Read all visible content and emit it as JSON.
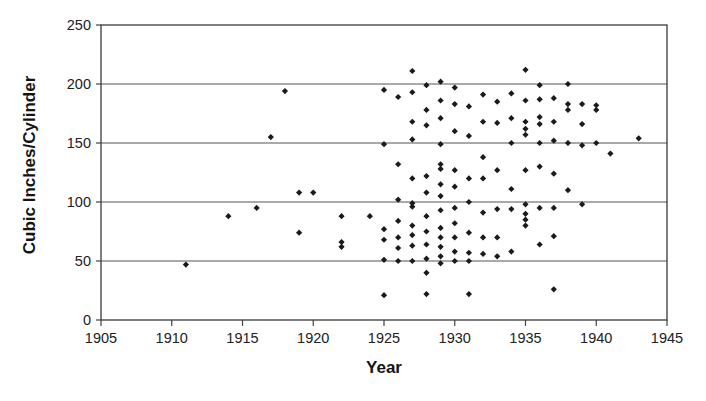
{
  "chart_data": {
    "type": "scatter",
    "title": "",
    "xlabel": "Year",
    "ylabel": "Cubic Inches/Cylinder",
    "xlim": [
      1905,
      1945
    ],
    "ylim": [
      0,
      250
    ],
    "xticks": [
      1905,
      1910,
      1915,
      1920,
      1925,
      1930,
      1935,
      1940,
      1945
    ],
    "yticks": [
      0,
      50,
      100,
      150,
      200,
      250
    ],
    "grid": "horizontal",
    "legend": null,
    "marker": "diamond",
    "marker_color": "#1a1a1a",
    "points": [
      [
        1911,
        47
      ],
      [
        1914,
        88
      ],
      [
        1916,
        95
      ],
      [
        1917,
        155
      ],
      [
        1918,
        194
      ],
      [
        1919,
        108
      ],
      [
        1919,
        74
      ],
      [
        1920,
        108
      ],
      [
        1922,
        88
      ],
      [
        1922,
        66
      ],
      [
        1922,
        62
      ],
      [
        1924,
        88
      ],
      [
        1925,
        195
      ],
      [
        1925,
        149
      ],
      [
        1925,
        77
      ],
      [
        1925,
        68
      ],
      [
        1925,
        51
      ],
      [
        1925,
        21
      ],
      [
        1926,
        189
      ],
      [
        1926,
        132
      ],
      [
        1926,
        102
      ],
      [
        1926,
        84
      ],
      [
        1926,
        70
      ],
      [
        1926,
        61
      ],
      [
        1926,
        50
      ],
      [
        1927,
        211
      ],
      [
        1927,
        193
      ],
      [
        1927,
        168
      ],
      [
        1927,
        153
      ],
      [
        1927,
        120
      ],
      [
        1927,
        99
      ],
      [
        1927,
        96
      ],
      [
        1927,
        80
      ],
      [
        1927,
        72
      ],
      [
        1927,
        63
      ],
      [
        1927,
        50
      ],
      [
        1928,
        199
      ],
      [
        1928,
        178
      ],
      [
        1928,
        165
      ],
      [
        1928,
        122
      ],
      [
        1928,
        108
      ],
      [
        1928,
        88
      ],
      [
        1928,
        75
      ],
      [
        1928,
        64
      ],
      [
        1928,
        52
      ],
      [
        1928,
        40
      ],
      [
        1928,
        22
      ],
      [
        1929,
        202
      ],
      [
        1929,
        186
      ],
      [
        1929,
        171
      ],
      [
        1929,
        149
      ],
      [
        1929,
        132
      ],
      [
        1929,
        128
      ],
      [
        1929,
        115
      ],
      [
        1929,
        105
      ],
      [
        1929,
        93
      ],
      [
        1929,
        78
      ],
      [
        1929,
        70
      ],
      [
        1929,
        62
      ],
      [
        1929,
        54
      ],
      [
        1929,
        48
      ],
      [
        1930,
        197
      ],
      [
        1930,
        183
      ],
      [
        1930,
        160
      ],
      [
        1930,
        127
      ],
      [
        1930,
        113
      ],
      [
        1930,
        95
      ],
      [
        1930,
        82
      ],
      [
        1930,
        70
      ],
      [
        1930,
        58
      ],
      [
        1930,
        50
      ],
      [
        1931,
        181
      ],
      [
        1931,
        156
      ],
      [
        1931,
        120
      ],
      [
        1931,
        100
      ],
      [
        1931,
        74
      ],
      [
        1931,
        57
      ],
      [
        1931,
        50
      ],
      [
        1931,
        22
      ],
      [
        1932,
        191
      ],
      [
        1932,
        168
      ],
      [
        1932,
        138
      ],
      [
        1932,
        120
      ],
      [
        1932,
        91
      ],
      [
        1932,
        70
      ],
      [
        1932,
        56
      ],
      [
        1933,
        185
      ],
      [
        1933,
        167
      ],
      [
        1933,
        127
      ],
      [
        1933,
        94
      ],
      [
        1933,
        70
      ],
      [
        1933,
        54
      ],
      [
        1934,
        192
      ],
      [
        1934,
        171
      ],
      [
        1934,
        150
      ],
      [
        1934,
        111
      ],
      [
        1934,
        94
      ],
      [
        1934,
        58
      ],
      [
        1935,
        212
      ],
      [
        1935,
        186
      ],
      [
        1935,
        168
      ],
      [
        1935,
        162
      ],
      [
        1935,
        157
      ],
      [
        1935,
        127
      ],
      [
        1935,
        98
      ],
      [
        1935,
        90
      ],
      [
        1935,
        85
      ],
      [
        1935,
        80
      ],
      [
        1936,
        199
      ],
      [
        1936,
        187
      ],
      [
        1936,
        172
      ],
      [
        1936,
        166
      ],
      [
        1936,
        150
      ],
      [
        1936,
        130
      ],
      [
        1936,
        95
      ],
      [
        1936,
        64
      ],
      [
        1937,
        188
      ],
      [
        1937,
        168
      ],
      [
        1937,
        152
      ],
      [
        1937,
        124
      ],
      [
        1937,
        95
      ],
      [
        1937,
        71
      ],
      [
        1937,
        26
      ],
      [
        1938,
        200
      ],
      [
        1938,
        183
      ],
      [
        1938,
        178
      ],
      [
        1938,
        150
      ],
      [
        1938,
        110
      ],
      [
        1939,
        183
      ],
      [
        1939,
        166
      ],
      [
        1939,
        148
      ],
      [
        1939,
        98
      ],
      [
        1940,
        182
      ],
      [
        1940,
        178
      ],
      [
        1940,
        150
      ],
      [
        1941,
        141
      ],
      [
        1943,
        154
      ]
    ]
  },
  "axis": {
    "ylabel_text": "Cubic Inches/Cylinder",
    "xlabel_text": "Year",
    "ytick_labels": [
      "0",
      "50",
      "100",
      "150",
      "200",
      "250"
    ],
    "xtick_labels": [
      "1905",
      "1910",
      "1915",
      "1920",
      "1925",
      "1930",
      "1935",
      "1940",
      "1945"
    ]
  }
}
